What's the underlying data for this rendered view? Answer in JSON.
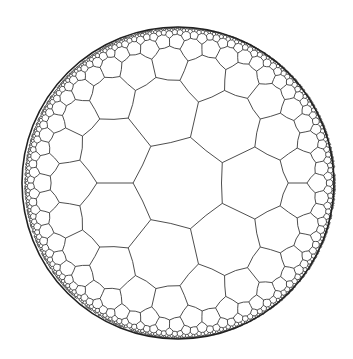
{
  "diagram": {
    "type": "hyperbolic-tiling",
    "model": "poincare-disk",
    "schlafli": {
      "p": 7,
      "q": 3
    },
    "disk": {
      "cx": 178,
      "cy": 183,
      "r": 156
    },
    "tiling_center": {
      "x": 180,
      "y": 183
    },
    "central_vertex_angle_deg": 180,
    "max_depth": 7,
    "colors": {
      "background": "#ffffff",
      "edge": "#3a3a3a",
      "boundary": "#222222",
      "fill": "#ffffff"
    },
    "edge_width": 0.9
  }
}
